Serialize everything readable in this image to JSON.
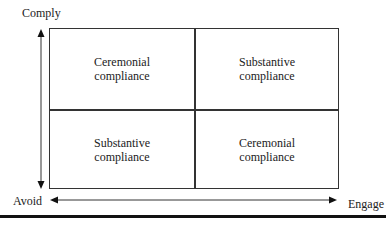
{
  "axes": {
    "y_top_label": "Comply",
    "x_left_label": "Avoid",
    "x_right_label": "Engage"
  },
  "quadrants": {
    "top_left": {
      "line1": "Ceremonial",
      "line2": "compliance"
    },
    "top_right": {
      "line1": "Substantive",
      "line2": "compliance"
    },
    "bottom_left": {
      "line1": "Substantive",
      "line2": "compliance"
    },
    "bottom_right": {
      "line1": "Ceremonial",
      "line2": "compliance"
    }
  }
}
